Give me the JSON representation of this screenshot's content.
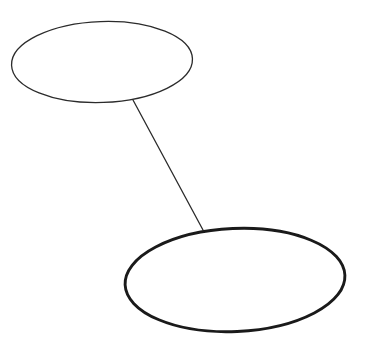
{
  "canvas": {
    "width": 371,
    "height": 346,
    "background_color": "#ffffff",
    "title": "Two Ellipses Connected by a Line"
  },
  "diagram": {
    "type": "node-link-diagram",
    "node_count": 2,
    "edge_count": 1,
    "nodes": [
      {
        "id": "ellipse-top-left",
        "label": "",
        "shape": "ellipse",
        "cx": 102,
        "cy": 62,
        "rx": 90.5,
        "ry": 40.5,
        "rotation_deg": -2,
        "stroke_color": "#2b2b2b",
        "stroke_width": 1.3,
        "fill_color": "none"
      },
      {
        "id": "ellipse-bottom-right",
        "label": "",
        "shape": "ellipse",
        "cx": 235,
        "cy": 280,
        "rx": 110,
        "ry": 51.5,
        "rotation_deg": -2.5,
        "stroke_color": "#1a1a1a",
        "stroke_width": 2.9,
        "fill_color": "none"
      }
    ],
    "edges": [
      {
        "id": "edge-top-to-bottom",
        "from": "ellipse-top-left",
        "to": "ellipse-bottom-right",
        "x1": 133,
        "y1": 100,
        "x2": 203,
        "y2": 230,
        "stroke_color": "#2b2b2b",
        "stroke_width": 1.3
      }
    ]
  }
}
